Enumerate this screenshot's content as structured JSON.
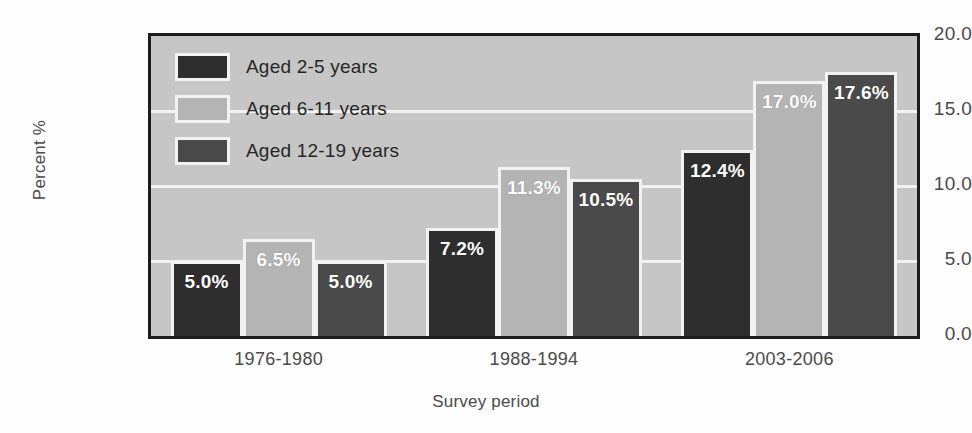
{
  "chart_data": {
    "type": "bar",
    "title": "",
    "subtitle": "",
    "xlabel": "Survey period",
    "ylabel": "Percent %",
    "categories": [
      "1976-1980",
      "1988-1994",
      "2003-2006"
    ],
    "series": [
      {
        "name": "Aged 2-5 years",
        "values": [
          5.0,
          7.2,
          12.4
        ],
        "color": "#2e2e2e",
        "labels": [
          "5.0%",
          "7.2%",
          "12.4%"
        ]
      },
      {
        "name": "Aged 6-11 years",
        "values": [
          6.5,
          11.3,
          17.0
        ],
        "color": "#b4b4b4",
        "labels": [
          "6.5%",
          "11.3%",
          "17.0%"
        ]
      },
      {
        "name": "Aged 12-19 years",
        "values": [
          5.0,
          10.5,
          17.6
        ],
        "color": "#4a4a4a",
        "labels": [
          "5.0%",
          "10.5%",
          "17.6%"
        ]
      }
    ],
    "ylim": [
      0.0,
      20.0
    ],
    "yticks": [
      0.0,
      5.0,
      10.0,
      15.0,
      20.0
    ],
    "ytick_labels": [
      "0.0",
      "5.0",
      "10.0",
      "15.0",
      "20.0"
    ],
    "grid": true,
    "grid_color": "#f2f2f2",
    "legend_position": "top-left-inside",
    "plot_background": "#c6c6c6",
    "plot_border_color": "#1d1d1d",
    "bar_outline_color": "#f2f2f2",
    "data_label_color": "#ffffff"
  },
  "legend": {
    "items": [
      {
        "label": "Aged 2-5 years"
      },
      {
        "label": "Aged 6-11 years"
      },
      {
        "label": "Aged 12-19 years"
      }
    ]
  },
  "axes": {
    "y_title": "Percent %",
    "x_title": "Survey period",
    "y_ticks": [
      "20.0",
      "15.0",
      "10.0",
      "5.0",
      "0.0"
    ],
    "x_ticks": [
      "1976-1980",
      "1988-1994",
      "2003-2006"
    ]
  }
}
